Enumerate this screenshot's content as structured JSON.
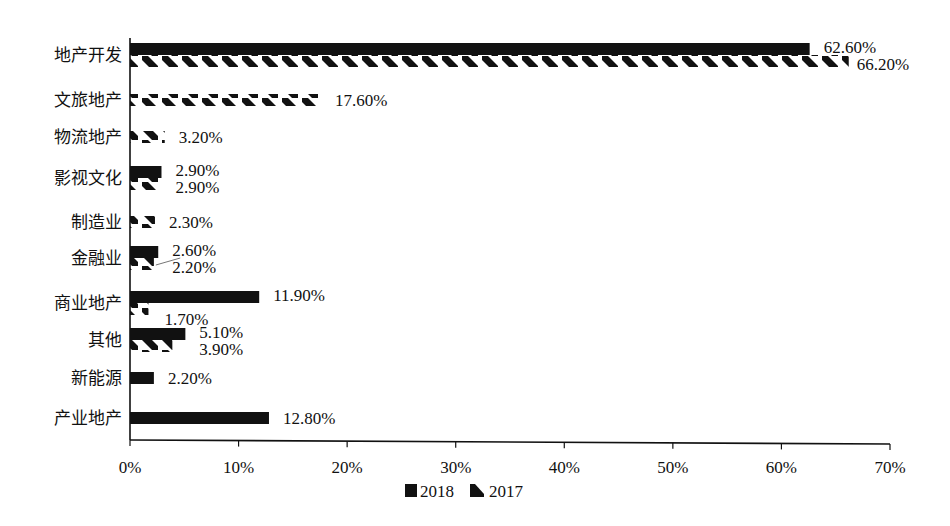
{
  "chart_data": {
    "type": "bar",
    "orientation": "horizontal",
    "title": "",
    "xlabel": "",
    "ylabel": "",
    "xlim": [
      0,
      70
    ],
    "x_ticks": [
      "0%",
      "10%",
      "20%",
      "30%",
      "40%",
      "50%",
      "60%",
      "70%"
    ],
    "grid": false,
    "legend_position": "bottom",
    "categories": [
      "地产开发",
      "文旅地产",
      "物流地产",
      "影视文化",
      "制造业",
      "金融业",
      "商业地产",
      "其他",
      "新能源",
      "产业地产"
    ],
    "series": [
      {
        "name": "2018",
        "style": "solid",
        "color": "#111111",
        "values": [
          62.6,
          null,
          null,
          2.9,
          null,
          2.6,
          11.9,
          5.1,
          2.2,
          12.8
        ],
        "labels": [
          "62.60%",
          "",
          "",
          "2.90%",
          "",
          "2.60%",
          "11.90%",
          "5.10%",
          "2.20%",
          "12.80%"
        ]
      },
      {
        "name": "2017",
        "style": "hatched",
        "color": "#111111",
        "values": [
          66.2,
          17.6,
          3.2,
          2.9,
          2.3,
          2.2,
          1.7,
          3.9,
          null,
          null
        ],
        "labels": [
          "66.20%",
          "17.60%",
          "3.20%",
          "2.90%",
          "2.30%",
          "2.20%",
          "1.70%",
          "3.90%",
          "",
          ""
        ]
      }
    ]
  }
}
